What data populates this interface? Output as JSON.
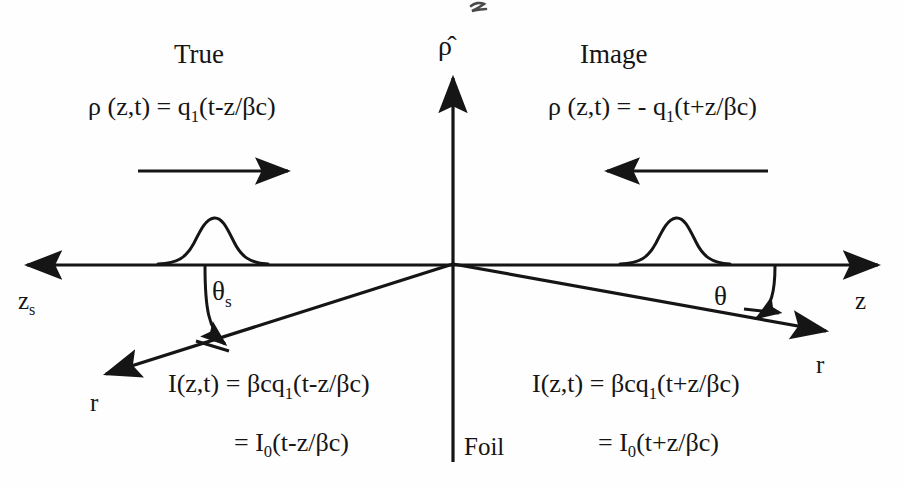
{
  "figure": {
    "kind": "physics-schematic",
    "background_color": "#ffffff",
    "line_color": "#151515"
  },
  "axes": {
    "vertical": {
      "label": "ρ̂",
      "name": "rho-hat-axis",
      "direction": "up"
    },
    "horizontal_right": {
      "label": "z",
      "name": "z-axis",
      "direction": "right"
    },
    "horizontal_left": {
      "label": "z",
      "sub": "s",
      "name": "zs-axis",
      "direction": "left"
    },
    "radial_left": {
      "label": "r",
      "name": "r-axis-left",
      "direction": "down-left"
    },
    "radial_right": {
      "label": "r",
      "name": "r-axis-right",
      "direction": "down-right"
    }
  },
  "left_panel": {
    "title": "True",
    "charge_density_eq": {
      "lhs": "ρ (z,t) = q",
      "sub": "1",
      "rhs": "(t-z/βc)"
    },
    "motion_arrow_direction": "right",
    "angle_label": "θ",
    "angle_sub": "s",
    "intensity_eq_line1": {
      "lhs": "I(z,t) = βcq",
      "sub": "1",
      "rhs": "(t-z/βc)"
    },
    "intensity_eq_line2": {
      "lhs": "= I",
      "sub": "0",
      "rhs": "(t-z/βc)"
    }
  },
  "right_panel": {
    "title": "Image",
    "charge_density_eq": {
      "lhs": "ρ (z,t) = - q",
      "sub": "1",
      "rhs": "(t+z/βc)"
    },
    "motion_arrow_direction": "left",
    "angle_label": "θ",
    "intensity_eq_line1": {
      "lhs": "I(z,t) = βcq",
      "sub": "1",
      "rhs": "(t+z/βc)"
    },
    "intensity_eq_line2": {
      "lhs": "= I",
      "sub": "0",
      "rhs": "(t+z/βc)"
    }
  },
  "foil": {
    "label": "Foil"
  },
  "bunches": {
    "left": {
      "name": "gaussian-bunch-left",
      "peak_height": 46
    },
    "right": {
      "name": "gaussian-bunch-right",
      "peak_height": 46
    }
  },
  "artifact": {
    "top_partial_glyph": "z"
  }
}
